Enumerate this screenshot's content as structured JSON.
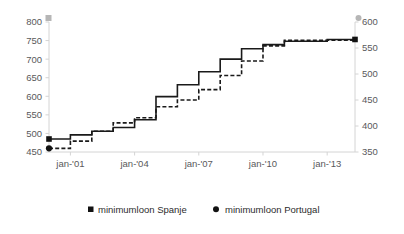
{
  "chart_data": {
    "type": "line",
    "title": "",
    "subtitle": "",
    "xlabel": "",
    "ylabel": "",
    "grid": false,
    "legend_position": "bottom",
    "x_tick_labels": [
      "jan-'01",
      "jan-'04",
      "jan-'07",
      "jan-'10",
      "jan-'13"
    ],
    "x_tick_years": [
      2001,
      2004,
      2007,
      2010,
      2013
    ],
    "x_range": [
      "jan-'00",
      "jul-'14"
    ],
    "axes": [
      {
        "name": "left",
        "series": "minimumloon Spanje",
        "ylim": [
          450,
          800
        ],
        "ticks": [
          450,
          500,
          550,
          600,
          650,
          700,
          750,
          800
        ],
        "tick_labels": [
          "450",
          "500",
          "550",
          "600",
          "650",
          "700",
          "750",
          "800"
        ],
        "cap_marker": "square"
      },
      {
        "name": "right",
        "series": "minimumloon Portugal",
        "ylim": [
          350,
          600
        ],
        "ticks": [
          350,
          400,
          450,
          500,
          550,
          600
        ],
        "tick_labels": [
          "350",
          "400",
          "450",
          "500",
          "550",
          "600"
        ],
        "cap_marker": "circle"
      }
    ],
    "series": [
      {
        "name": "minimumloon Spanje",
        "axis": "left",
        "marker": "square",
        "line_style": "solid",
        "color": "#1a1a1a",
        "x": [
          2000.0,
          2000.25,
          2000.5,
          2000.75,
          2001.0,
          2001.25,
          2001.5,
          2001.75,
          2002.0,
          2002.25,
          2002.5,
          2002.75,
          2003.0,
          2003.25,
          2003.5,
          2003.75,
          2004.0,
          2004.25,
          2004.5,
          2004.75,
          2005.0,
          2005.25,
          2005.5,
          2005.75,
          2006.0,
          2006.25,
          2006.5,
          2006.75,
          2007.0,
          2007.25,
          2007.5,
          2007.75,
          2008.0,
          2008.25,
          2008.5,
          2008.75,
          2009.0,
          2009.25,
          2009.5,
          2009.75,
          2010.0,
          2010.25,
          2010.5,
          2010.75,
          2011.0,
          2011.25,
          2011.5,
          2011.75,
          2012.0,
          2012.25,
          2012.5,
          2012.75,
          2013.0,
          2013.25,
          2013.5,
          2013.75,
          2014.0,
          2014.3
        ],
        "values": [
          485,
          485,
          485,
          485,
          496,
          496,
          496,
          496,
          506,
          506,
          506,
          506,
          516,
          516,
          516,
          516,
          537,
          537,
          537,
          537,
          599,
          599,
          599,
          599,
          631,
          631,
          631,
          631,
          666,
          666,
          666,
          666,
          700,
          700,
          700,
          700,
          728,
          728,
          728,
          728,
          739,
          739,
          739,
          739,
          748,
          748,
          748,
          748,
          748,
          748,
          748,
          748,
          753,
          753,
          753,
          753,
          753,
          753
        ]
      },
      {
        "name": "minimumloon Portugal",
        "axis": "right",
        "marker": "circle",
        "line_style": "dashed",
        "color": "#1a1a1a",
        "x": [
          2000.0,
          2000.25,
          2000.5,
          2000.75,
          2001.0,
          2001.25,
          2001.5,
          2001.75,
          2002.0,
          2002.25,
          2002.5,
          2002.75,
          2003.0,
          2003.25,
          2003.5,
          2003.75,
          2004.0,
          2004.25,
          2004.5,
          2004.75,
          2005.0,
          2005.25,
          2005.5,
          2005.75,
          2006.0,
          2006.25,
          2006.5,
          2006.75,
          2007.0,
          2007.25,
          2007.5,
          2007.75,
          2008.0,
          2008.25,
          2008.5,
          2008.75,
          2009.0,
          2009.25,
          2009.5,
          2009.75,
          2010.0,
          2010.25,
          2010.5,
          2010.75,
          2011.0,
          2011.25,
          2011.5,
          2011.75,
          2012.0,
          2012.25,
          2012.5,
          2012.75,
          2013.0,
          2013.25,
          2013.5,
          2013.75,
          2014.0,
          2014.3
        ],
        "values": [
          357,
          357,
          357,
          357,
          371,
          371,
          371,
          371,
          390,
          390,
          390,
          390,
          406,
          406,
          406,
          406,
          416,
          416,
          416,
          416,
          437,
          437,
          437,
          437,
          450,
          450,
          450,
          450,
          470,
          470,
          470,
          470,
          497,
          497,
          497,
          497,
          525,
          525,
          525,
          525,
          554,
          554,
          554,
          554,
          565,
          565,
          565,
          565,
          565,
          565,
          565,
          565,
          565,
          565,
          565,
          565,
          565,
          565
        ]
      }
    ],
    "legend": [
      {
        "label": "minimumloon Spanje",
        "marker": "square"
      },
      {
        "label": "minimumloon Portugal",
        "marker": "circle"
      }
    ]
  }
}
